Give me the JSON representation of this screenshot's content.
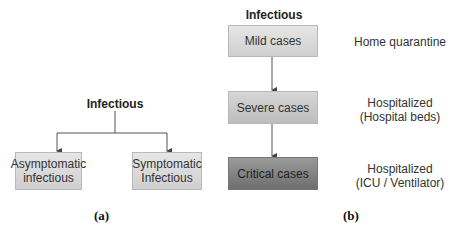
{
  "panel_a": {
    "title": "Infectious",
    "boxes": [
      {
        "line1": "Asymptomatic",
        "line2": "infectious"
      },
      {
        "line1": "Symptomatic",
        "line2": "Infectious"
      }
    ],
    "caption": "(a)"
  },
  "panel_b": {
    "title": "Infectious",
    "boxes": [
      {
        "label": "Mild cases"
      },
      {
        "label": "Severe cases"
      },
      {
        "label": "Critical cases"
      }
    ],
    "outcomes": [
      {
        "line1": "Home quarantine",
        "line2": ""
      },
      {
        "line1": "Hospitalized",
        "line2": "(Hospital beds)"
      },
      {
        "line1": "Hospitalized",
        "line2": "(ICU / Ventilator)"
      }
    ],
    "caption": "(b)"
  },
  "colors": {
    "line": "#555555",
    "box_light": "#dcdcdc",
    "box_mid": "#c8c8c8",
    "box_dark": "#858585"
  }
}
